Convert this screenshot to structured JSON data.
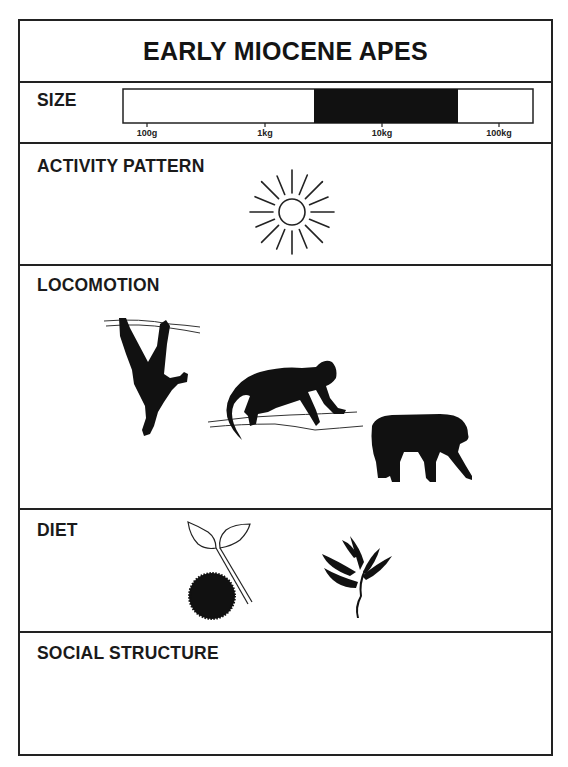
{
  "title": "EARLY MIOCENE APES",
  "sections": {
    "size": {
      "label": "SIZE",
      "scale_ticks": [
        "100g",
        "1kg",
        "10kg",
        "100kg"
      ],
      "filled_range": {
        "from": "~3kg",
        "to": "~40kg"
      }
    },
    "activity_pattern": {
      "label": "ACTIVITY PATTERN",
      "icon": "sun-icon",
      "meaning": "diurnal"
    },
    "locomotion": {
      "label": "LOCOMOTION",
      "icons": [
        "suspensory-ape-icon",
        "arboreal-quadruped-monkey-icon",
        "terrestrial-quadruped-ape-icon"
      ]
    },
    "diet": {
      "label": "DIET",
      "icons": [
        "fruit-icon",
        "leaves-icon"
      ]
    },
    "social_structure": {
      "label": "SOCIAL STRUCTURE",
      "icons": []
    }
  },
  "colors": {
    "ink": "#111111",
    "background": "#ffffff"
  }
}
